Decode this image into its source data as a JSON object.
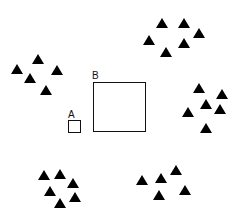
{
  "diagram": {
    "background": "#ffffff",
    "stroke_color": "#111111",
    "triangle_color": "#000000",
    "squares": [
      {
        "id": "A",
        "label": "A",
        "x": 68,
        "y": 120,
        "w": 13,
        "h": 13,
        "label_x": 68,
        "label_y": 110
      },
      {
        "id": "B",
        "label": "B",
        "x": 93,
        "y": 82,
        "w": 53,
        "h": 50,
        "label_x": 92,
        "label_y": 71
      }
    ],
    "triangle_clusters": [
      {
        "name": "top-right",
        "points": [
          [
            162,
            23
          ],
          [
            184,
            23
          ],
          [
            199,
            33
          ],
          [
            149,
            40
          ],
          [
            184,
            43
          ],
          [
            166,
            52
          ]
        ]
      },
      {
        "name": "left",
        "points": [
          [
            38,
            59
          ],
          [
            17,
            69
          ],
          [
            57,
            70
          ],
          [
            30,
            78
          ],
          [
            46,
            90
          ]
        ]
      },
      {
        "name": "right",
        "points": [
          [
            199,
            88
          ],
          [
            222,
            94
          ],
          [
            206,
            104
          ],
          [
            220,
            109
          ],
          [
            188,
            112
          ],
          [
            206,
            128
          ]
        ]
      },
      {
        "name": "bottom-left",
        "points": [
          [
            44,
            175
          ],
          [
            60,
            174
          ],
          [
            73,
            183
          ],
          [
            50,
            191
          ],
          [
            75,
            197
          ],
          [
            60,
            203
          ]
        ]
      },
      {
        "name": "bottom-right",
        "points": [
          [
            142,
            180
          ],
          [
            161,
            178
          ],
          [
            176,
            170
          ],
          [
            185,
            190
          ],
          [
            159,
            195
          ]
        ]
      }
    ]
  }
}
